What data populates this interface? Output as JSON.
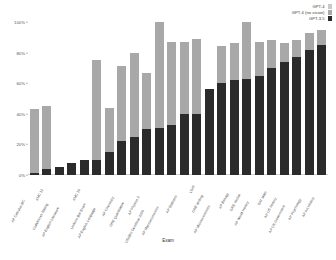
{
  "chart_data": {
    "type": "bar",
    "title": "",
    "subtitle": "",
    "xlabel": "Exam",
    "ylabel": "",
    "ylim": [
      0,
      100
    ],
    "ytick_labels": [
      "0%",
      "20%",
      "40%",
      "60%",
      "80%",
      "100%"
    ],
    "ytick_values": [
      0,
      20,
      40,
      60,
      80,
      100
    ],
    "grid": false,
    "legend_position": "top-right",
    "bar_mode": "overlaid",
    "sorted_by": "GPT-3.5 score ascending",
    "categories": [
      "AP Calculus BC",
      "AMC 12",
      "Codeforces Rating",
      "AP English Literature",
      "AMC 10",
      "Uniform Bar Exam",
      "AP English Language",
      "AP Chemistry",
      "GRE Quantitative",
      "AP Physics 2",
      "USABO Semifinal 2020",
      "AP Macroeconomics",
      "AP Statistics",
      "LSAT",
      "GRE Writing",
      "AP Microeconomics",
      "AP Biology",
      "GRE Verbal",
      "AP World History",
      "SAT Math",
      "AP US History",
      "AP US Government",
      "AP Psychology",
      "AP Art History"
    ],
    "series": [
      {
        "name": "GPT-4",
        "color": "#c9c9c9",
        "values": [
          43,
          45,
          5,
          8,
          10,
          75,
          44,
          71,
          80,
          67,
          100,
          87,
          87,
          89,
          56,
          84,
          86,
          100,
          87,
          88,
          86,
          88,
          93,
          95
        ]
      },
      {
        "name": "GPT-4 (no vision)",
        "color": "#a8a8a8",
        "values": [
          43,
          45,
          5,
          8,
          10,
          75,
          44,
          71,
          80,
          67,
          100,
          87,
          87,
          89,
          56,
          84,
          86,
          100,
          87,
          88,
          86,
          88,
          93,
          95
        ]
      },
      {
        "name": "GPT-3.5",
        "color": "#2b2b2b",
        "values": [
          1,
          4,
          5,
          8,
          10,
          10,
          15,
          22,
          25,
          30,
          31,
          33,
          40,
          40,
          56,
          60,
          62,
          63,
          65,
          70,
          74,
          77,
          82,
          85
        ]
      }
    ]
  },
  "legend": {
    "items": [
      {
        "label": "GPT-4",
        "color": "#c9c9c9",
        "swatch_icon": "legend-swatch-icon"
      },
      {
        "label": "GPT-4 (no vision)",
        "color": "#a8a8a8",
        "swatch_icon": "legend-swatch-icon"
      },
      {
        "label": "GPT-3.5",
        "color": "#2b2b2b",
        "swatch_icon": "legend-swatch-icon"
      }
    ]
  }
}
